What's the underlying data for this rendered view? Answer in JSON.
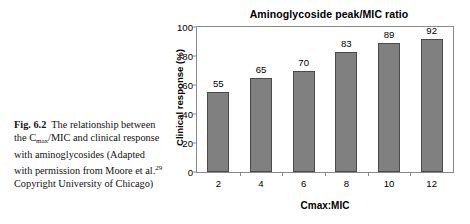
{
  "caption": {
    "fig_label": "Fig. 6.2",
    "text_part_1": "The relationship between the C",
    "subscript": "max",
    "text_part_2": "/MIC and clinical response with aminoglycosides (Adapted with permission from Moore et al.",
    "superscript": "29",
    "text_part_3": " Copyright University of Chicago)"
  },
  "chart_data": {
    "type": "bar",
    "title": "Aminoglycoside peak/MIC ratio",
    "xlabel": "Cmax:MIC",
    "ylabel": "Clinical response (%)",
    "categories": [
      "2",
      "4",
      "6",
      "8",
      "10",
      "12"
    ],
    "values": [
      55,
      65,
      70,
      83,
      89,
      92
    ],
    "value_labels": [
      "55",
      "65",
      "70",
      "83",
      "89",
      "92"
    ],
    "ylim": [
      0,
      100
    ],
    "yticks": [
      0,
      20,
      40,
      60,
      80,
      100
    ],
    "ytick_labels": [
      "0",
      "20",
      "40",
      "60",
      "80",
      "100"
    ],
    "grid": false,
    "legend": false,
    "bar_color": "#808080",
    "bar_border_color": "#4a4a4a",
    "axis_color": "#8a8a8a",
    "text_color": "#000000"
  }
}
